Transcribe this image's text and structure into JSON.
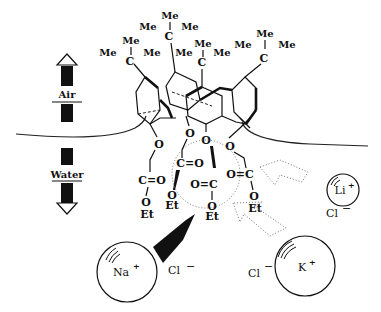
{
  "figure": {
    "phases": {
      "top": "Air",
      "bottom": "Water"
    },
    "substituents": {
      "tert_butyl": {
        "center": "C",
        "methyl": "Me"
      },
      "ester": {
        "carbonyl": "C=O",
        "carbonyl_rev": "O=C",
        "ether_o": "O",
        "ethyl": "Et"
      }
    },
    "ions": {
      "sodium": {
        "symbol": "Na",
        "charge": "+",
        "counter": "Cl",
        "counter_charge": "−",
        "arrow": "solid"
      },
      "lithium": {
        "symbol": "Li",
        "charge": "+",
        "counter": "Cl",
        "counter_charge": "−",
        "arrow": "dotted-open"
      },
      "potassium": {
        "symbol": "K",
        "charge": "+",
        "counter": "Cl",
        "counter_charge": "−",
        "arrow": "dotted-open"
      }
    },
    "colors": {
      "ink": "#111111",
      "background": "#ffffff",
      "dotted": "#777777"
    }
  }
}
